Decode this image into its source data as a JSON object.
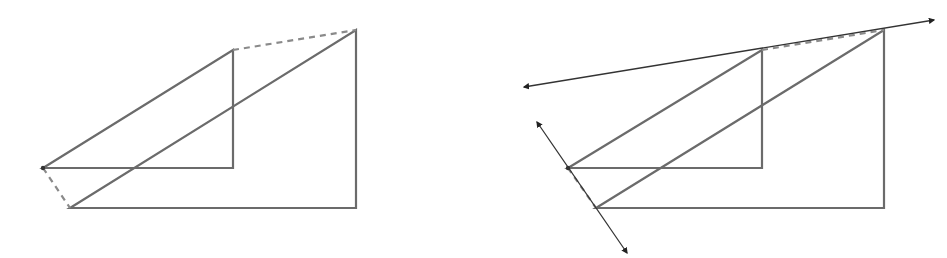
{
  "diagram": {
    "colors": {
      "shape": "#6b6b6b",
      "dashed": "#8a8a8a",
      "line": "#333333",
      "background": "#ffffff"
    },
    "panels": [
      {
        "id": "left",
        "small_triangle": [
          [
            43,
            168
          ],
          [
            233,
            50
          ],
          [
            233,
            168
          ]
        ],
        "large_triangle": [
          [
            70,
            208
          ],
          [
            356,
            30
          ],
          [
            356,
            208
          ]
        ],
        "dashed_segments": [
          [
            [
              233,
              50
            ],
            [
              356,
              30
            ]
          ],
          [
            [
              43,
              168
            ],
            [
              70,
              208
            ]
          ]
        ],
        "lines": [],
        "points": [
          [
            43,
            168
          ]
        ]
      },
      {
        "id": "right",
        "small_triangle": [
          [
            568,
            168
          ],
          [
            762,
            50
          ],
          [
            762,
            168
          ]
        ],
        "large_triangle": [
          [
            596,
            208
          ],
          [
            884,
            30
          ],
          [
            884,
            208
          ]
        ],
        "dashed_segments": [
          [
            [
              762,
              50
            ],
            [
              884,
              30
            ]
          ],
          [
            [
              568,
              168
            ],
            [
              596,
              208
            ]
          ]
        ],
        "lines": [
          {
            "from": [
              524,
              87
            ],
            "to": [
              934,
              20
            ],
            "arrows": "both"
          },
          {
            "from": [
              537,
              122
            ],
            "to": [
              627,
              253
            ],
            "arrows": "both"
          }
        ],
        "points": [
          [
            568,
            168
          ]
        ]
      }
    ]
  }
}
